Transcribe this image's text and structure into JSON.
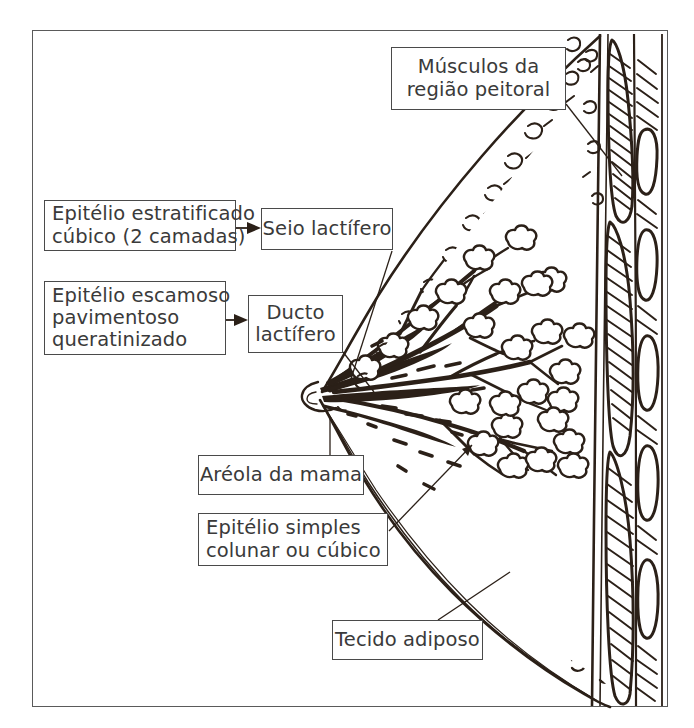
{
  "figure": {
    "language": "pt-BR",
    "line_color": "#2b2018",
    "box_border_color": "#4a4a4a",
    "text_color": "#3a3a3a",
    "background": "#ffffff"
  },
  "labels": {
    "musculos": {
      "line1": "Músculos da",
      "line2": "região peitoral"
    },
    "epitelio_estratificado": {
      "line1": "Epitélio estratificado",
      "line2": "cúbico (2 camadas)"
    },
    "seio_lactifero": {
      "line1": "Seio lactífero"
    },
    "epitelio_escamoso": {
      "line1": "Epitélio escamoso",
      "line2": "pavimentoso",
      "line3": "queratinizado"
    },
    "ducto_lactifero": {
      "line1": "Ducto",
      "line2": "lactífero"
    },
    "areola": {
      "line1": "Aréola da mama"
    },
    "epitelio_simples": {
      "line1": "Epitélio simples",
      "line2": "colunar ou cúbico"
    },
    "tecido_adiposo": {
      "line1": "Tecido adiposo"
    }
  },
  "structures": [
    {
      "name": "musculos-da-regiao-peitoral",
      "description": "pectoral muscle bands, hatched, right side"
    },
    {
      "name": "costelas",
      "description": "ribs shown as white ovals within muscle column"
    },
    {
      "name": "seio-lactifero",
      "description": "lactiferous sinus near nipple"
    },
    {
      "name": "ducto-lactifero",
      "description": "lactiferous duct radiating from nipple"
    },
    {
      "name": "areola-da-mama",
      "description": "areola at nipple tip"
    },
    {
      "name": "alveolos",
      "description": "alveolar lobule clusters at duct tips"
    },
    {
      "name": "tecido-adiposo",
      "description": "adipose tissue stippling under skin"
    }
  ]
}
